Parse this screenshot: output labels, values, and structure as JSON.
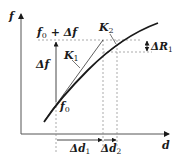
{
  "diagram": {
    "axes": {
      "y_label": "f",
      "x_label": "d"
    },
    "labels": {
      "f0_plus_df": {
        "base": "f",
        "sub": "0",
        "rest": " + Δf"
      },
      "delta_f": "Δf",
      "f0": {
        "base": "f",
        "sub": "0"
      },
      "k1": {
        "base": "K",
        "sub": "1"
      },
      "k2": {
        "base": "K",
        "sub": "2"
      },
      "delta_r1": {
        "base": "ΔR",
        "sub": "1"
      },
      "delta_d1": {
        "base": "Δd",
        "sub": "1"
      },
      "delta_d2": {
        "base": "Δd",
        "sub": "2"
      }
    },
    "colors": {
      "line": "#1a1a1a",
      "dashed": "#777777"
    }
  }
}
